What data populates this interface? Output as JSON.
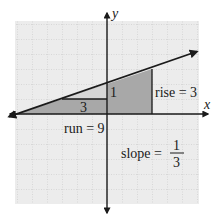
{
  "axes": {
    "x_label": "x",
    "y_label": "y",
    "origin_px": [
      107,
      114
    ],
    "unit_px": 15
  },
  "line": {
    "equation_slope": "1/3",
    "points": [
      [
        -6,
        0
      ],
      [
        -3,
        1
      ],
      [
        0,
        2
      ],
      [
        3,
        3
      ]
    ]
  },
  "small_triangle": {
    "run_label": "3",
    "rise_label": "1"
  },
  "large_triangle": {
    "run_label": "run = 9",
    "rise_label": "rise = 3"
  },
  "slope_text": {
    "prefix": "slope =",
    "numerator": "1",
    "denominator": "3"
  },
  "colors": {
    "grid_bg": "#ececec",
    "grid_line": "#b8b8b8",
    "dark_shade": "#a8a8a8",
    "light_shade": "#d6d6d6",
    "ink": "#1a1a1a"
  }
}
